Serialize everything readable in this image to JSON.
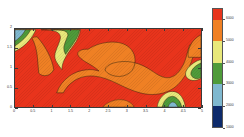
{
  "figure": {
    "background": "#ffffff",
    "plot_frame_color": "#3a3a3a"
  },
  "chart_data": {
    "type": "heatmap",
    "subtype": "filled-contour",
    "title": "",
    "subtitle": "",
    "xlabel": "",
    "ylabel": "",
    "xlim": [
      0,
      5
    ],
    "ylim": [
      0,
      2
    ],
    "grid": false,
    "legend_position": "right",
    "x_ticks": [
      0,
      0.5,
      1,
      1.5,
      2,
      2.5,
      3,
      3.5,
      4,
      4.5,
      5
    ],
    "x_tick_labels": [
      "0",
      "0.5",
      "1",
      "1.5",
      "2",
      "2.5",
      "3",
      "3.5",
      "4",
      "4.5",
      "5"
    ],
    "y_ticks": [
      0,
      0.5,
      1,
      1.5,
      2
    ],
    "y_tick_labels": [
      "0",
      "0.5",
      "1",
      "1.5",
      "2"
    ],
    "colorbar": {
      "orientation": "vertical",
      "vmin": 1000,
      "vmax": 6500,
      "tick_values": [
        6000,
        5000,
        4000,
        3000,
        2000,
        1000
      ],
      "tick_labels": [
        "6000",
        "5000",
        "4000",
        "3000",
        "2000",
        "1000"
      ],
      "levels": [
        1000,
        2000,
        3000,
        4000,
        5000,
        6000,
        6500
      ],
      "band_colors": [
        "#0d2a6b",
        "#7fb8cf",
        "#4f9b3a",
        "#e8e87a",
        "#ef8024",
        "#e8341c"
      ],
      "band_labels": [
        "1000-2000",
        "2000-3000",
        "3000-4000",
        "4000-5000",
        "5000-6000",
        "6000-6500"
      ]
    },
    "regions": [
      {
        "name": "background-high",
        "color": "#e8341c",
        "level_range": [
          6000,
          6500
        ],
        "description": "dominant red field covering most of the domain"
      },
      {
        "name": "central-mid-mass",
        "color": "#ef8024",
        "level_range": [
          5000,
          6000
        ],
        "description": "large orange region spanning the centre of the domain"
      },
      {
        "name": "top-left-low-core",
        "color": "#7fb8cf",
        "level_range": [
          2000,
          3000
        ],
        "description": "light blue low-value core at the upper-left corner"
      },
      {
        "name": "top-left-ring-green",
        "color": "#4f9b3a",
        "level_range": [
          3000,
          4000
        ],
        "description": "green ring around the upper-left core"
      },
      {
        "name": "top-left-ring-yellow",
        "color": "#e8e87a",
        "level_range": [
          4000,
          5000
        ],
        "description": "yellow ring around the upper-left core"
      },
      {
        "name": "top-green-blob",
        "color": "#4f9b3a",
        "level_range": [
          3000,
          4000
        ],
        "description": "green blob along the top edge near x=1.1-1.8"
      },
      {
        "name": "mid-right-pocket",
        "color": "#4f9b3a",
        "level_range": [
          3000,
          4000
        ],
        "description": "green pocket on the right edge near y=1.0"
      },
      {
        "name": "bottom-right-pocket",
        "color": "#4f9b3a",
        "level_range": [
          3000,
          4000
        ],
        "description": "green pocket on the bottom-right near x=4.5, y=0"
      }
    ]
  }
}
